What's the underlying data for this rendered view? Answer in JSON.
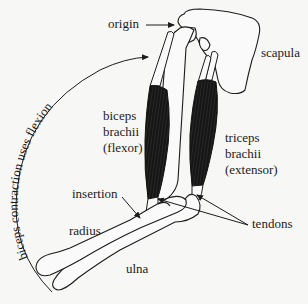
{
  "diagram": {
    "background": "#f7f7f5",
    "line_color": "#1c1c1c",
    "muscle_color": "#161616",
    "labels": {
      "origin": "origin",
      "scapula": "scapula",
      "biceps": [
        "biceps",
        "brachii",
        "(flexor)"
      ],
      "triceps": [
        "triceps",
        "brachii",
        "(extensor)"
      ],
      "insertion": "insertion",
      "radius": "radius",
      "ulna": "ulna",
      "tendons": "tendons",
      "arc_caption": "biceps contraction uses flexion"
    }
  }
}
